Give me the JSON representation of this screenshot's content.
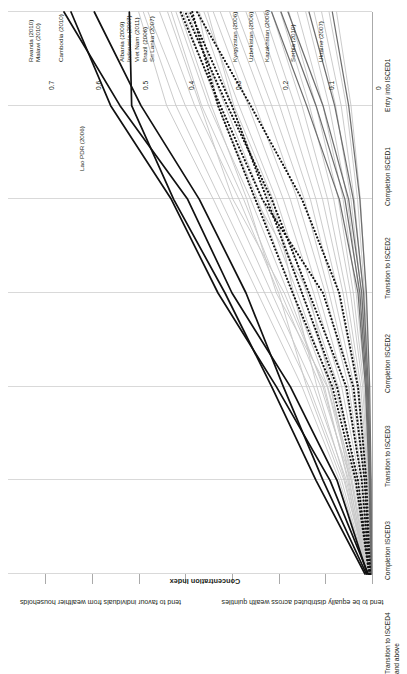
{
  "chart_data": {
    "type": "line",
    "title": "",
    "xlabel": "",
    "ylabel": "Concentration Index",
    "ylim": [
      0,
      0.75
    ],
    "yticks": [
      "0",
      "0.1",
      "0.2",
      "0.3",
      "0.4",
      "0.5",
      "0.6",
      "0.7"
    ],
    "ytick_values": [
      0,
      0.1,
      0.2,
      0.3,
      0.4,
      0.5,
      0.6,
      0.7
    ],
    "grid": true,
    "legend_position": "none",
    "orientation": "rotated-90",
    "categories": [
      "Entry into ISCED1",
      "Completion ISCED1",
      "Transition to ISCED2",
      "Completion ISCED2",
      "Transition to ISCED3",
      "Completion ISCED3",
      "Transition to ISCED4 and above"
    ],
    "annotations": [
      "tend to favour individuals from wealthier households",
      "tend to be equally distributed across wealth quintiles"
    ],
    "series": [
      {
        "name": "Rwanda (2010)",
        "style": "solid-black",
        "group": "high",
        "labelled": true,
        "values": [
          0.01,
          0.075,
          0.175,
          0.3,
          0.395,
          0.54,
          0.66
        ]
      },
      {
        "name": "Malawi (2010)",
        "style": "solid-black",
        "group": "high",
        "labelled": true,
        "values": [
          0.008,
          0.09,
          0.205,
          0.33,
          0.43,
          0.56,
          0.645
        ]
      },
      {
        "name": "Cambodia (2010)",
        "style": "solid-black",
        "group": "high",
        "labelled": true,
        "values": [
          0.012,
          0.105,
          0.19,
          0.27,
          0.37,
          0.495,
          0.595
        ]
      },
      {
        "name": "Lao PDR (2006)",
        "style": "solid-black",
        "group": "high",
        "labelled": true,
        "values": [
          0.015,
          0.12,
          0.215,
          0.315,
          0.425,
          0.515,
          0.52
        ]
      },
      {
        "name": "Albania (2009)",
        "style": "dotted-black",
        "group": "mid",
        "labelled": true,
        "values": [
          0.004,
          0.016,
          0.04,
          0.105,
          0.235,
          0.325,
          0.41
        ]
      },
      {
        "name": "Indonesia (2007)",
        "style": "dotted-black",
        "group": "mid",
        "labelled": true,
        "values": [
          0.005,
          0.022,
          0.055,
          0.135,
          0.215,
          0.31,
          0.4
        ]
      },
      {
        "name": "Viet Nam (2011)",
        "style": "dotted-black",
        "group": "mid",
        "labelled": true,
        "values": [
          0.006,
          0.03,
          0.075,
          0.15,
          0.225,
          0.3,
          0.39
        ]
      },
      {
        "name": "Brazil (2006)",
        "style": "dotted-black",
        "group": "mid",
        "labelled": true,
        "values": [
          0.006,
          0.035,
          0.085,
          0.17,
          0.25,
          0.33,
          0.385
        ]
      },
      {
        "name": "Sri Lanka (2007)",
        "style": "dotted-black",
        "group": "mid",
        "labelled": true,
        "values": [
          0.004,
          0.012,
          0.03,
          0.07,
          0.15,
          0.26,
          0.375
        ]
      },
      {
        "name": "Kyrgyzstan (2006)",
        "style": "solid-darkgrey",
        "group": "low",
        "labelled": true,
        "values": [
          0.002,
          0.006,
          0.014,
          0.03,
          0.07,
          0.14,
          0.215
        ]
      },
      {
        "name": "Uzbekistan (2006)",
        "style": "solid-darkgrey",
        "group": "low",
        "labelled": true,
        "values": [
          0.002,
          0.005,
          0.012,
          0.026,
          0.058,
          0.12,
          0.195
        ]
      },
      {
        "name": "Kazakhstan (2006)",
        "style": "solid-darkgrey",
        "group": "low",
        "labelled": true,
        "values": [
          0.002,
          0.004,
          0.01,
          0.022,
          0.05,
          0.105,
          0.18
        ]
      },
      {
        "name": "Serbia (2010)",
        "style": "solid-darkgrey",
        "group": "low",
        "labelled": true,
        "values": [
          0.001,
          0.003,
          0.008,
          0.018,
          0.04,
          0.08,
          0.135
        ]
      },
      {
        "name": "Ukraine (2007)",
        "style": "solid-darkgrey",
        "group": "low",
        "labelled": true,
        "values": [
          0.001,
          0.002,
          0.005,
          0.012,
          0.026,
          0.05,
          0.085
        ]
      },
      {
        "name": "",
        "style": "solid-lightgrey",
        "group": "other",
        "labelled": false,
        "values": [
          0.01,
          0.07,
          0.15,
          0.245,
          0.34,
          0.44,
          0.5
        ]
      },
      {
        "name": "",
        "style": "solid-lightgrey",
        "group": "other",
        "labelled": false,
        "values": [
          0.009,
          0.06,
          0.135,
          0.23,
          0.325,
          0.42,
          0.49
        ]
      },
      {
        "name": "",
        "style": "solid-lightgrey",
        "group": "other",
        "labelled": false,
        "values": [
          0.008,
          0.055,
          0.125,
          0.215,
          0.305,
          0.4,
          0.48
        ]
      },
      {
        "name": "",
        "style": "solid-lightgrey",
        "group": "other",
        "labelled": false,
        "values": [
          0.01,
          0.065,
          0.14,
          0.2,
          0.285,
          0.38,
          0.455
        ]
      },
      {
        "name": "",
        "style": "solid-lightgrey",
        "group": "other",
        "labelled": false,
        "values": [
          0.007,
          0.045,
          0.11,
          0.195,
          0.275,
          0.365,
          0.43
        ]
      },
      {
        "name": "",
        "style": "solid-lightgrey",
        "group": "other",
        "labelled": false,
        "values": [
          0.008,
          0.05,
          0.105,
          0.18,
          0.26,
          0.35,
          0.42
        ]
      },
      {
        "name": "",
        "style": "solid-lightgrey",
        "group": "other",
        "labelled": false,
        "values": [
          0.006,
          0.038,
          0.095,
          0.17,
          0.245,
          0.33,
          0.405
        ]
      },
      {
        "name": "",
        "style": "solid-lightgrey",
        "group": "other",
        "labelled": false,
        "values": [
          0.007,
          0.042,
          0.09,
          0.16,
          0.235,
          0.315,
          0.395
        ]
      },
      {
        "name": "",
        "style": "solid-lightgrey",
        "group": "other",
        "labelled": false,
        "values": [
          0.005,
          0.03,
          0.08,
          0.15,
          0.22,
          0.3,
          0.37
        ]
      },
      {
        "name": "",
        "style": "solid-lightgrey",
        "group": "other",
        "labelled": false,
        "values": [
          0.006,
          0.034,
          0.072,
          0.14,
          0.205,
          0.285,
          0.36
        ]
      },
      {
        "name": "",
        "style": "solid-lightgrey",
        "group": "other",
        "labelled": false,
        "values": [
          0.005,
          0.026,
          0.065,
          0.125,
          0.19,
          0.265,
          0.34
        ]
      },
      {
        "name": "",
        "style": "solid-lightgrey",
        "group": "other",
        "labelled": false,
        "values": [
          0.004,
          0.022,
          0.058,
          0.115,
          0.175,
          0.25,
          0.325
        ]
      },
      {
        "name": "",
        "style": "solid-lightgrey",
        "group": "other",
        "labelled": false,
        "values": [
          0.004,
          0.02,
          0.05,
          0.1,
          0.16,
          0.23,
          0.305
        ]
      },
      {
        "name": "",
        "style": "solid-lightgrey",
        "group": "other",
        "labelled": false,
        "values": [
          0.003,
          0.016,
          0.044,
          0.092,
          0.145,
          0.215,
          0.29
        ]
      },
      {
        "name": "",
        "style": "solid-lightgrey",
        "group": "other",
        "labelled": false,
        "values": [
          0.003,
          0.014,
          0.038,
          0.082,
          0.132,
          0.198,
          0.27
        ]
      },
      {
        "name": "",
        "style": "solid-lightgrey",
        "group": "other",
        "labelled": false,
        "values": [
          0.003,
          0.012,
          0.032,
          0.072,
          0.12,
          0.182,
          0.25
        ]
      },
      {
        "name": "",
        "style": "solid-lightgrey",
        "group": "other",
        "labelled": false,
        "values": [
          0.002,
          0.01,
          0.028,
          0.062,
          0.106,
          0.165,
          0.232
        ]
      },
      {
        "name": "",
        "style": "solid-lightgrey",
        "group": "other",
        "labelled": false,
        "values": [
          0.002,
          0.009,
          0.024,
          0.055,
          0.095,
          0.15,
          0.215
        ]
      },
      {
        "name": "",
        "style": "solid-lightgrey",
        "group": "other",
        "labelled": false,
        "values": [
          0.002,
          0.008,
          0.02,
          0.046,
          0.082,
          0.134,
          0.196
        ]
      },
      {
        "name": "",
        "style": "solid-lightgrey",
        "group": "other",
        "labelled": false,
        "values": [
          0.002,
          0.007,
          0.017,
          0.04,
          0.072,
          0.12,
          0.178
        ]
      },
      {
        "name": "",
        "style": "solid-lightgrey",
        "group": "other",
        "labelled": false,
        "values": [
          0.001,
          0.006,
          0.014,
          0.034,
          0.062,
          0.105,
          0.16
        ]
      },
      {
        "name": "",
        "style": "solid-lightgrey",
        "group": "other",
        "labelled": false,
        "values": [
          0.001,
          0.005,
          0.012,
          0.028,
          0.053,
          0.092,
          0.142
        ]
      },
      {
        "name": "",
        "style": "solid-lightgrey",
        "group": "other",
        "labelled": false,
        "values": [
          0.001,
          0.004,
          0.01,
          0.023,
          0.045,
          0.078,
          0.124
        ]
      },
      {
        "name": "",
        "style": "solid-lightgrey",
        "group": "other",
        "labelled": false,
        "values": [
          0.001,
          0.004,
          0.009,
          0.019,
          0.038,
          0.066,
          0.108
        ]
      },
      {
        "name": "",
        "style": "solid-lightgrey",
        "group": "other",
        "labelled": false,
        "values": [
          0.001,
          0.003,
          0.007,
          0.016,
          0.031,
          0.055,
          0.092
        ]
      },
      {
        "name": "",
        "style": "solid-lightgrey",
        "group": "other",
        "labelled": false,
        "values": [
          0.001,
          0.003,
          0.006,
          0.013,
          0.025,
          0.045,
          0.076
        ]
      },
      {
        "name": "",
        "style": "solid-lightgrey",
        "group": "other",
        "labelled": false,
        "values": [
          0.012,
          0.048,
          0.088,
          0.135,
          0.25,
          0.33,
          0.372
        ]
      },
      {
        "name": "",
        "style": "solid-lightgrey",
        "group": "other",
        "labelled": false,
        "values": [
          0.011,
          0.044,
          0.096,
          0.205,
          0.268,
          0.344,
          0.412
        ]
      },
      {
        "name": "",
        "style": "solid-lightgrey",
        "group": "other",
        "labelled": false,
        "values": [
          0.009,
          0.058,
          0.118,
          0.168,
          0.212,
          0.296,
          0.352
        ]
      },
      {
        "name": "",
        "style": "solid-lightgrey",
        "group": "other",
        "labelled": false,
        "values": [
          0.013,
          0.052,
          0.102,
          0.188,
          0.298,
          0.368,
          0.438
        ]
      }
    ]
  },
  "colors": {
    "solid-black": "#111111",
    "dotted-black": "#111111",
    "solid-darkgrey": "#6e6e6e",
    "solid-lightgrey": "#c8c8c8",
    "grid": "#d9d9d9",
    "axis": "#aaaaaa",
    "text": "#231f20"
  },
  "axis": {
    "y_title": "Concentration Index"
  }
}
